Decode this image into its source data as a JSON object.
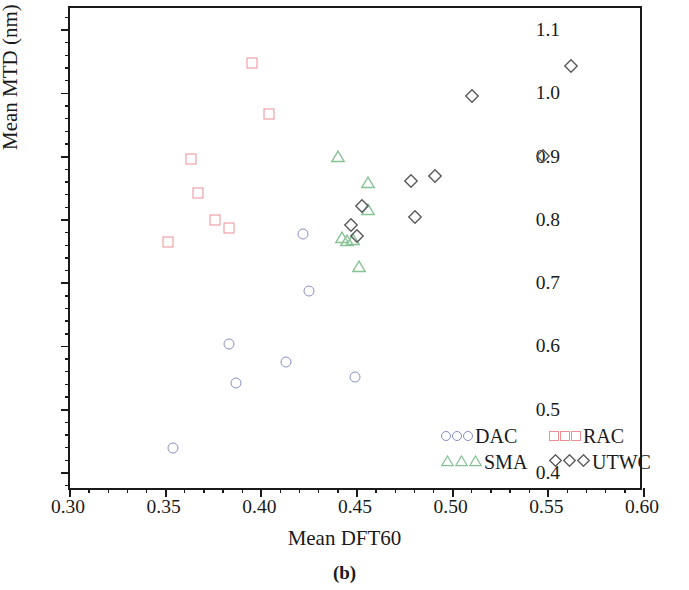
{
  "figure": {
    "caption": "(b)",
    "xlabel": "Mean DFT60",
    "ylabel": "Mean MTD (nm)"
  },
  "axes": {
    "x_ticks": [
      "0.30",
      "0.35",
      "0.40",
      "0.45",
      "0.50",
      "0.55",
      "0.60"
    ],
    "y_ticks": [
      "0.4",
      "0.5",
      "0.6",
      "0.7",
      "0.8",
      "0.9",
      "1.0",
      "1.1"
    ]
  },
  "legend": {
    "entries": [
      {
        "label": "DAC",
        "marker": "circle",
        "color": "#8a8ec4"
      },
      {
        "label": "RAC",
        "marker": "square",
        "color": "#ec8f95"
      },
      {
        "label": "SMA",
        "marker": "triangle",
        "color": "#87c295"
      },
      {
        "label": "UTWC",
        "marker": "diamond",
        "color": "#5a5a5a"
      }
    ]
  },
  "chart_data": {
    "type": "scatter",
    "title": "",
    "xlabel": "Mean DFT60",
    "ylabel": "Mean MTD (nm)",
    "xlim": [
      0.3,
      0.6
    ],
    "ylim": [
      0.37,
      1.135
    ],
    "xticks": [
      0.3,
      0.35,
      0.4,
      0.45,
      0.5,
      0.55,
      0.6
    ],
    "yticks": [
      0.4,
      0.5,
      0.6,
      0.7,
      0.8,
      0.9,
      1.0,
      1.1
    ],
    "x_minor_per_major": 5,
    "y_minor_per_major": 5,
    "grid": false,
    "legend_position": "lower right",
    "series": [
      {
        "name": "DAC",
        "marker": "circle",
        "color": "#8a8ec4",
        "points": [
          {
            "x": 0.354,
            "y": 0.44
          },
          {
            "x": 0.383,
            "y": 0.604
          },
          {
            "x": 0.387,
            "y": 0.542
          },
          {
            "x": 0.413,
            "y": 0.576
          },
          {
            "x": 0.422,
            "y": 0.778
          },
          {
            "x": 0.425,
            "y": 0.688
          },
          {
            "x": 0.449,
            "y": 0.552
          }
        ]
      },
      {
        "name": "RAC",
        "marker": "square",
        "color": "#ec8f95",
        "points": [
          {
            "x": 0.351,
            "y": 0.765
          },
          {
            "x": 0.363,
            "y": 0.896
          },
          {
            "x": 0.367,
            "y": 0.843
          },
          {
            "x": 0.376,
            "y": 0.8
          },
          {
            "x": 0.383,
            "y": 0.787
          },
          {
            "x": 0.395,
            "y": 1.048
          },
          {
            "x": 0.404,
            "y": 0.968
          }
        ]
      },
      {
        "name": "SMA",
        "marker": "triangle",
        "color": "#87c295",
        "points": [
          {
            "x": 0.44,
            "y": 0.901
          },
          {
            "x": 0.442,
            "y": 0.773
          },
          {
            "x": 0.445,
            "y": 0.768
          },
          {
            "x": 0.448,
            "y": 0.77
          },
          {
            "x": 0.451,
            "y": 0.727
          },
          {
            "x": 0.456,
            "y": 0.86
          },
          {
            "x": 0.4555,
            "y": 0.817
          }
        ]
      },
      {
        "name": "UTWC",
        "marker": "diamond",
        "color": "#5a5a5a",
        "points": [
          {
            "x": 0.447,
            "y": 0.792
          },
          {
            "x": 0.45,
            "y": 0.775
          },
          {
            "x": 0.4525,
            "y": 0.822
          },
          {
            "x": 0.478,
            "y": 0.862
          },
          {
            "x": 0.4805,
            "y": 0.804
          },
          {
            "x": 0.491,
            "y": 0.869
          },
          {
            "x": 0.51,
            "y": 0.996
          },
          {
            "x": 0.547,
            "y": 0.901
          },
          {
            "x": 0.562,
            "y": 1.043
          }
        ]
      }
    ]
  }
}
